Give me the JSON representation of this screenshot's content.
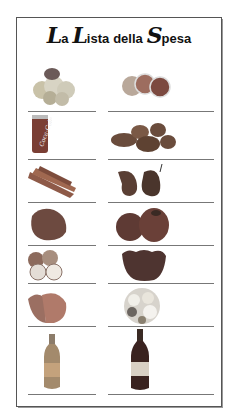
{
  "title": {
    "parts": [
      {
        "cap": "L",
        "rest": "a"
      },
      {
        "cap": "L",
        "rest": "ista"
      },
      {
        "plain": "della"
      },
      {
        "cap": "S",
        "rest": "pesa"
      }
    ],
    "full": "La Lista della Spesa"
  },
  "rows": [
    {
      "left": "mixed-fruit-icon",
      "right": "oranges-icon"
    },
    {
      "left": "coca-cola-can-icon",
      "right": "potatoes-icon"
    },
    {
      "left": "carrots-icon",
      "right": "pears-icon"
    },
    {
      "left": "meat-icon",
      "right": "peppers-icon"
    },
    {
      "left": "apples-icon",
      "right": "strawberries-icon"
    },
    {
      "left": "salmon-steak-icon",
      "right": "flowers-icon"
    },
    {
      "left": "mineral-water-bottle-icon",
      "right": "wine-bottle-icon"
    }
  ],
  "can_label": "Coca-Cola",
  "colors": {
    "border": "#555555",
    "line": "#777777"
  }
}
